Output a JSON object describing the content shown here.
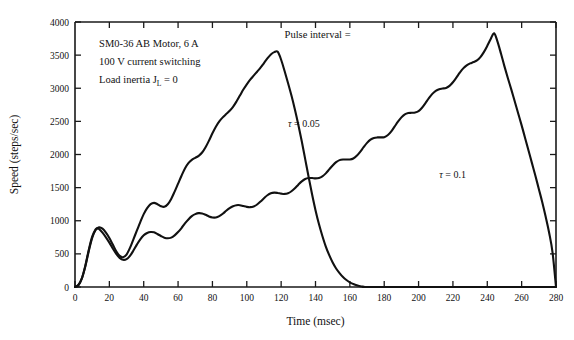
{
  "chart_data": {
    "type": "line",
    "title": "",
    "xlabel": "Time  (msec)",
    "ylabel": "Speed  (steps/sec)",
    "xlim": [
      0,
      280
    ],
    "ylim": [
      0,
      4000
    ],
    "xticks": [
      0,
      20,
      40,
      60,
      80,
      100,
      120,
      140,
      160,
      180,
      200,
      220,
      240,
      260,
      280
    ],
    "yticks": [
      0,
      500,
      1000,
      1500,
      2000,
      2500,
      3000,
      3500,
      4000
    ],
    "grid": false,
    "legend_position": "inline-annotation",
    "annotations": [
      {
        "name": "motor-spec-line-1",
        "text": "SM0-36 AB Motor, 6 A",
        "x": 14,
        "y": 3620
      },
      {
        "name": "motor-spec-line-2",
        "text": "100 V current switching",
        "x": 14,
        "y": 3350
      },
      {
        "name": "motor-spec-line-3-pre",
        "text": "Load inertia J",
        "sub": "L",
        "post": " = 0",
        "x": 14,
        "y": 3080
      },
      {
        "name": "pulse-interval-note",
        "text": "Pulse interval =",
        "x": 122,
        "y": 3760
      }
    ],
    "series": [
      {
        "name": "tau = 0.05",
        "label_symbol": "τ",
        "label_text": " = 0.05",
        "label_x": 124,
        "label_y": 2420,
        "color": "#111111",
        "points": [
          [
            0,
            0
          ],
          [
            2,
            30
          ],
          [
            4,
            130
          ],
          [
            6,
            310
          ],
          [
            8,
            540
          ],
          [
            10,
            740
          ],
          [
            12,
            860
          ],
          [
            14,
            900
          ],
          [
            16,
            880
          ],
          [
            18,
            820
          ],
          [
            20,
            740
          ],
          [
            22,
            640
          ],
          [
            24,
            540
          ],
          [
            26,
            470
          ],
          [
            28,
            450
          ],
          [
            30,
            490
          ],
          [
            32,
            590
          ],
          [
            34,
            720
          ],
          [
            36,
            850
          ],
          [
            38,
            980
          ],
          [
            40,
            1100
          ],
          [
            42,
            1190
          ],
          [
            44,
            1250
          ],
          [
            46,
            1270
          ],
          [
            48,
            1250
          ],
          [
            50,
            1220
          ],
          [
            52,
            1210
          ],
          [
            54,
            1250
          ],
          [
            56,
            1330
          ],
          [
            58,
            1440
          ],
          [
            60,
            1560
          ],
          [
            62,
            1680
          ],
          [
            64,
            1790
          ],
          [
            66,
            1870
          ],
          [
            68,
            1920
          ],
          [
            70,
            1950
          ],
          [
            72,
            1980
          ],
          [
            74,
            2030
          ],
          [
            76,
            2110
          ],
          [
            78,
            2210
          ],
          [
            80,
            2320
          ],
          [
            82,
            2420
          ],
          [
            84,
            2500
          ],
          [
            86,
            2560
          ],
          [
            88,
            2610
          ],
          [
            90,
            2660
          ],
          [
            92,
            2720
          ],
          [
            94,
            2800
          ],
          [
            96,
            2890
          ],
          [
            98,
            2980
          ],
          [
            100,
            3060
          ],
          [
            102,
            3130
          ],
          [
            104,
            3190
          ],
          [
            106,
            3250
          ],
          [
            108,
            3310
          ],
          [
            110,
            3380
          ],
          [
            112,
            3450
          ],
          [
            114,
            3510
          ],
          [
            116,
            3545
          ],
          [
            118,
            3550
          ],
          [
            120,
            3430
          ],
          [
            122,
            3260
          ],
          [
            124,
            3080
          ],
          [
            126,
            2890
          ],
          [
            128,
            2680
          ],
          [
            130,
            2450
          ],
          [
            132,
            2200
          ],
          [
            134,
            1930
          ],
          [
            136,
            1660
          ],
          [
            138,
            1400
          ],
          [
            140,
            1160
          ],
          [
            142,
            950
          ],
          [
            144,
            770
          ],
          [
            146,
            610
          ],
          [
            148,
            480
          ],
          [
            150,
            370
          ],
          [
            152,
            280
          ],
          [
            154,
            210
          ],
          [
            156,
            150
          ],
          [
            158,
            105
          ],
          [
            160,
            70
          ],
          [
            162,
            45
          ],
          [
            164,
            25
          ],
          [
            166,
            12
          ],
          [
            168,
            5
          ],
          [
            170,
            0
          ],
          [
            200,
            0
          ],
          [
            280,
            0
          ]
        ]
      },
      {
        "name": "tau = 0.1",
        "label_symbol": "τ",
        "label_text": " = 0.1",
        "label_x": 212,
        "label_y": 1640,
        "color": "#111111",
        "points": [
          [
            0,
            0
          ],
          [
            2,
            30
          ],
          [
            4,
            130
          ],
          [
            6,
            320
          ],
          [
            8,
            560
          ],
          [
            10,
            760
          ],
          [
            12,
            870
          ],
          [
            13,
            885
          ],
          [
            14,
            875
          ],
          [
            16,
            820
          ],
          [
            18,
            750
          ],
          [
            20,
            670
          ],
          [
            22,
            580
          ],
          [
            24,
            500
          ],
          [
            26,
            440
          ],
          [
            28,
            410
          ],
          [
            30,
            420
          ],
          [
            32,
            470
          ],
          [
            34,
            550
          ],
          [
            36,
            640
          ],
          [
            38,
            720
          ],
          [
            40,
            780
          ],
          [
            42,
            815
          ],
          [
            44,
            830
          ],
          [
            46,
            825
          ],
          [
            48,
            800
          ],
          [
            50,
            770
          ],
          [
            52,
            745
          ],
          [
            54,
            735
          ],
          [
            56,
            745
          ],
          [
            58,
            780
          ],
          [
            60,
            830
          ],
          [
            62,
            890
          ],
          [
            64,
            960
          ],
          [
            66,
            1020
          ],
          [
            68,
            1070
          ],
          [
            70,
            1100
          ],
          [
            72,
            1115
          ],
          [
            74,
            1110
          ],
          [
            76,
            1090
          ],
          [
            78,
            1065
          ],
          [
            80,
            1050
          ],
          [
            82,
            1050
          ],
          [
            84,
            1070
          ],
          [
            86,
            1105
          ],
          [
            88,
            1150
          ],
          [
            90,
            1190
          ],
          [
            92,
            1220
          ],
          [
            94,
            1235
          ],
          [
            96,
            1235
          ],
          [
            98,
            1222
          ],
          [
            100,
            1210
          ],
          [
            102,
            1205
          ],
          [
            104,
            1215
          ],
          [
            106,
            1245
          ],
          [
            108,
            1290
          ],
          [
            110,
            1340
          ],
          [
            112,
            1385
          ],
          [
            114,
            1415
          ],
          [
            116,
            1425
          ],
          [
            118,
            1420
          ],
          [
            120,
            1410
          ],
          [
            122,
            1405
          ],
          [
            124,
            1415
          ],
          [
            126,
            1445
          ],
          [
            128,
            1490
          ],
          [
            130,
            1545
          ],
          [
            132,
            1595
          ],
          [
            134,
            1630
          ],
          [
            136,
            1645
          ],
          [
            138,
            1645
          ],
          [
            140,
            1640
          ],
          [
            142,
            1645
          ],
          [
            144,
            1670
          ],
          [
            146,
            1715
          ],
          [
            148,
            1775
          ],
          [
            150,
            1835
          ],
          [
            152,
            1885
          ],
          [
            154,
            1915
          ],
          [
            156,
            1925
          ],
          [
            158,
            1925
          ],
          [
            160,
            1925
          ],
          [
            162,
            1940
          ],
          [
            164,
            1980
          ],
          [
            166,
            2040
          ],
          [
            168,
            2110
          ],
          [
            170,
            2175
          ],
          [
            172,
            2225
          ],
          [
            174,
            2250
          ],
          [
            176,
            2258
          ],
          [
            178,
            2258
          ],
          [
            180,
            2262
          ],
          [
            182,
            2290
          ],
          [
            184,
            2345
          ],
          [
            186,
            2420
          ],
          [
            188,
            2495
          ],
          [
            190,
            2560
          ],
          [
            192,
            2605
          ],
          [
            194,
            2625
          ],
          [
            196,
            2630
          ],
          [
            198,
            2635
          ],
          [
            200,
            2655
          ],
          [
            202,
            2705
          ],
          [
            204,
            2775
          ],
          [
            206,
            2850
          ],
          [
            208,
            2915
          ],
          [
            210,
            2960
          ],
          [
            212,
            2985
          ],
          [
            214,
            2995
          ],
          [
            216,
            3005
          ],
          [
            218,
            3035
          ],
          [
            220,
            3090
          ],
          [
            222,
            3160
          ],
          [
            224,
            3235
          ],
          [
            226,
            3300
          ],
          [
            228,
            3345
          ],
          [
            230,
            3375
          ],
          [
            232,
            3395
          ],
          [
            234,
            3420
          ],
          [
            236,
            3470
          ],
          [
            238,
            3545
          ],
          [
            240,
            3640
          ],
          [
            242,
            3745
          ],
          [
            244,
            3830
          ],
          [
            246,
            3700
          ],
          [
            248,
            3520
          ],
          [
            250,
            3330
          ],
          [
            252,
            3150
          ],
          [
            254,
            2980
          ],
          [
            256,
            2800
          ],
          [
            258,
            2620
          ],
          [
            260,
            2440
          ],
          [
            262,
            2250
          ],
          [
            264,
            2060
          ],
          [
            266,
            1870
          ],
          [
            268,
            1680
          ],
          [
            270,
            1480
          ],
          [
            272,
            1280
          ],
          [
            274,
            1060
          ],
          [
            276,
            820
          ],
          [
            278,
            520
          ],
          [
            280,
            0
          ]
        ]
      }
    ]
  }
}
